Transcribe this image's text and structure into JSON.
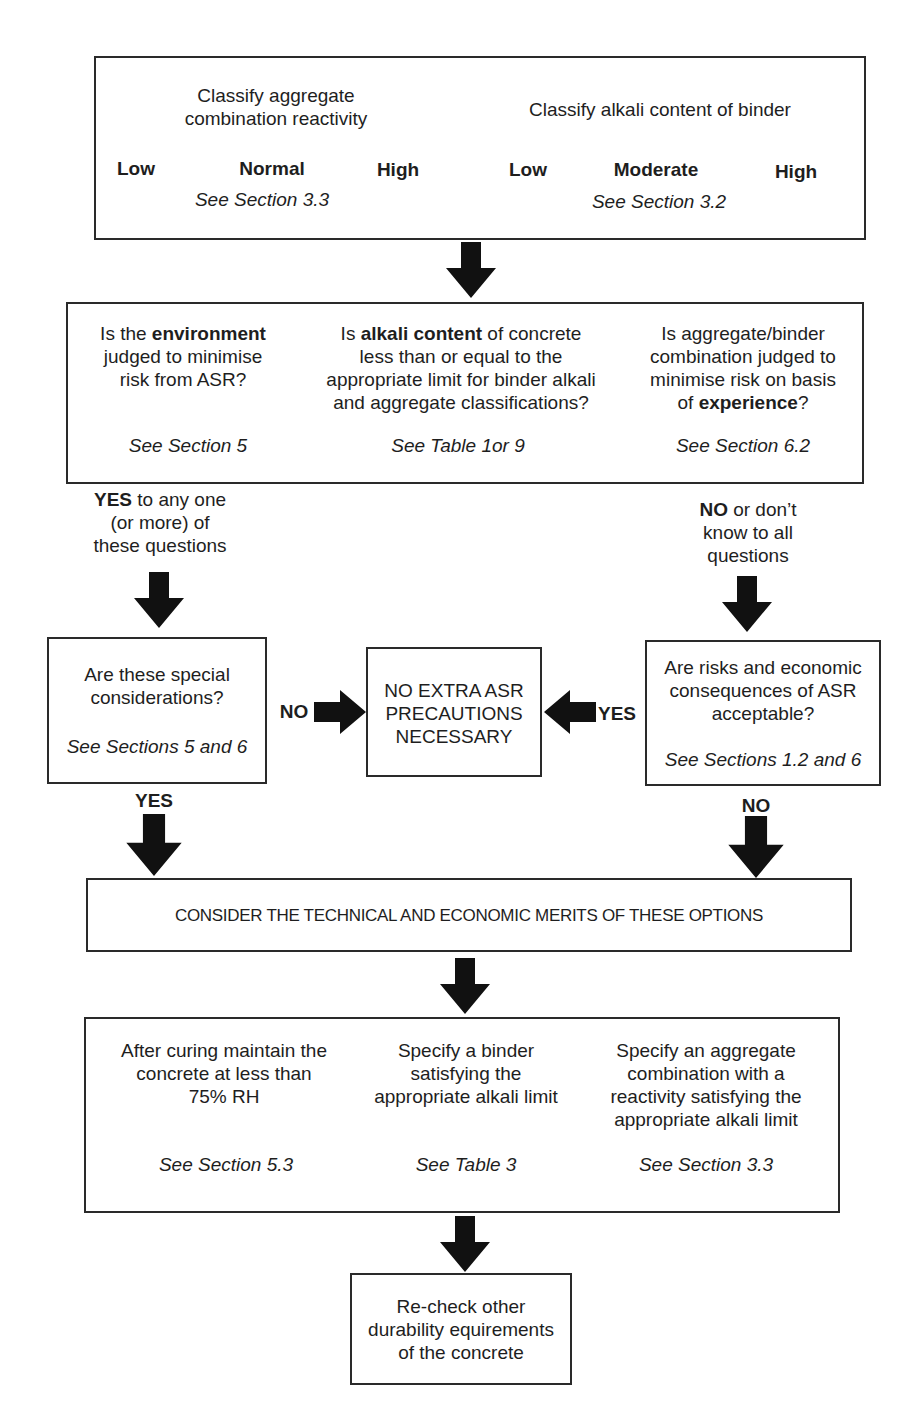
{
  "colors": {
    "line": "#2a2a2a",
    "text": "#1e1e1e",
    "background": "#ffffff",
    "arrow": "#111111"
  },
  "step1": {
    "aggregate": {
      "title_line1": "Classify aggregate",
      "title_line2": "combination reactivity",
      "levels": [
        "Low",
        "Normal",
        "High"
      ],
      "ref": "See Section 3.3"
    },
    "binder": {
      "title": "Classify alkali content of binder",
      "levels": [
        "Low",
        "Moderate",
        "High"
      ],
      "ref": "See Section 3.2"
    }
  },
  "step2": {
    "questions": [
      {
        "pre": "Is the ",
        "bold": "environment",
        "lines": [
          "judged to minimise",
          "risk from ASR?"
        ],
        "ref": "See Section 5"
      },
      {
        "pre": "Is ",
        "bold": "alkali content",
        "post": " of concrete",
        "lines": [
          "less than or equal to the",
          "appropriate limit for binder alkali",
          "and aggregate classifications?"
        ],
        "ref": "See Table 1or 9"
      },
      {
        "lines_top": [
          "Is aggregate/binder",
          "combination judged to",
          "minimise risk on basis"
        ],
        "pre": "of ",
        "bold": "experience",
        "post": "?",
        "ref": "See Section 6.2"
      }
    ]
  },
  "branch_yes": {
    "bold": "YES",
    "rest": " to any one",
    "line2": "(or more) of",
    "line3": "these questions"
  },
  "branch_no": {
    "bold": "NO",
    "rest": " or don’t",
    "line2": "know to all",
    "line3": "questions"
  },
  "special": {
    "line1": "Are these special",
    "line2": "considerations?",
    "ref": "See Sections 5 and 6",
    "no_label": "NO",
    "yes_label": "YES"
  },
  "no_extra": {
    "line1": "NO EXTRA ASR",
    "line2": "PRECAUTIONS",
    "line3": "NECESSARY"
  },
  "risks": {
    "line1": "Are risks and economic",
    "line2": "consequences of ASR",
    "line3": "acceptable?",
    "ref": "See Sections 1.2 and 6",
    "yes_label": "YES",
    "no_label": "NO"
  },
  "consider": {
    "text": "CONSIDER THE TECHNICAL AND ECONOMIC MERITS OF THESE OPTIONS"
  },
  "options": [
    {
      "lines": [
        "After curing maintain the",
        "concrete at less than",
        "75% RH"
      ],
      "ref": "See Section 5.3"
    },
    {
      "lines": [
        "Specify a binder",
        "satisfying the",
        "appropriate alkali limit"
      ],
      "ref": "See Table 3"
    },
    {
      "lines": [
        "Specify an aggregate",
        "combination with a",
        "reactivity satisfying the",
        "appropriate alkali limit"
      ],
      "ref": "See Section 3.3"
    }
  ],
  "recheck": {
    "line1": "Re-check other",
    "line2": "durability equirements",
    "line3": "of the concrete"
  }
}
